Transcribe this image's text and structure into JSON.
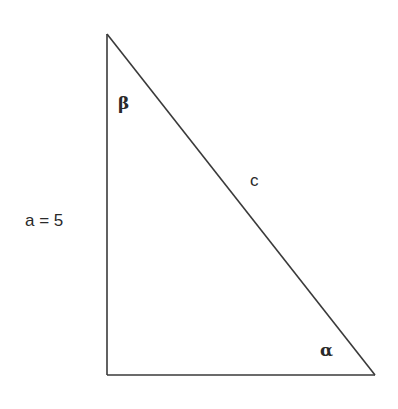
{
  "diagram": {
    "type": "right-triangle",
    "vertices": {
      "top": [
        107,
        34
      ],
      "bottom_left": [
        107,
        375
      ],
      "bottom_right": [
        375,
        375
      ]
    },
    "labels": {
      "side_a": "a = 5",
      "hypotenuse": "c",
      "angle_top": "β",
      "angle_bottom_right": "α"
    },
    "stroke_color": "#3a3a3a",
    "background": "#ffffff"
  }
}
